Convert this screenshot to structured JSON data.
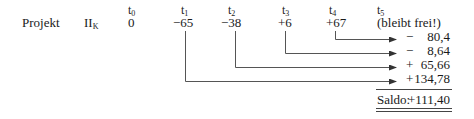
{
  "time_labels": [
    {
      "base": "t",
      "sub": "0"
    },
    {
      "base": "t",
      "sub": "1"
    },
    {
      "base": "t",
      "sub": "2"
    },
    {
      "base": "t",
      "sub": "3"
    },
    {
      "base": "t",
      "sub": "4"
    },
    {
      "base": "t",
      "sub": "5"
    }
  ],
  "row": {
    "label": "Projekt",
    "project_base": "II",
    "project_sub": "K",
    "values": [
      "0",
      "−65",
      "−38",
      "+6",
      "+67",
      "(bleibt frei!)"
    ]
  },
  "results": [
    {
      "sign": "−",
      "value": "80,4"
    },
    {
      "sign": "−",
      "value": "8,64"
    },
    {
      "sign": "+",
      "value": "65,66"
    },
    {
      "sign": "+",
      "value": "134,78"
    }
  ],
  "saldo": {
    "label": "Saldo:",
    "value": "+111,40"
  },
  "colors": {
    "text": "#1a1a1a",
    "lines": "#555555"
  }
}
